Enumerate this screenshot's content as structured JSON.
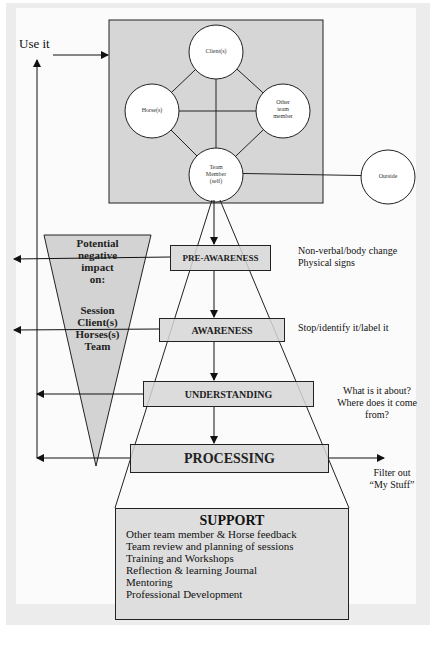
{
  "diagram": {
    "use_it_label": "Use it",
    "nodes": {
      "client": "Client(s)",
      "horse": "Horse(s)",
      "other_team_member": [
        "Other",
        "team",
        "member"
      ],
      "team_member": [
        "Team",
        "Member",
        "(self)"
      ],
      "outside": "Outside"
    },
    "impact": {
      "heading": [
        "Potential",
        "negative",
        "impact",
        "on:"
      ],
      "items": [
        "Session",
        "Client(s)",
        "Horses(s)",
        "Team"
      ]
    },
    "stages": [
      {
        "label": "PRE-AWARENESS",
        "notes": [
          "Non-verbal/body change",
          "Physical signs"
        ]
      },
      {
        "label": "AWARENESS",
        "notes": [
          "Stop/identify it/label it"
        ]
      },
      {
        "label": "UNDERSTANDING",
        "notes": [
          "What is it about?",
          "Where does it come",
          "from?"
        ]
      },
      {
        "label": "PROCESSING",
        "notes": [
          "Filter out",
          "“My Stuff”"
        ]
      }
    ],
    "support": {
      "title": "SUPPORT",
      "items": [
        "Other team member & Horse feedback",
        "Team review and planning of sessions",
        "Training and Workshops",
        "Reflection & learning Journal",
        "Mentoring",
        "Professional Development"
      ]
    },
    "colors": {
      "box_fill": "#d9d9d9",
      "line": "#222222",
      "frame": "#ececec"
    }
  }
}
